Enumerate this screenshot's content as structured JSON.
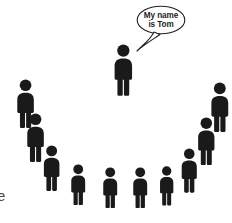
{
  "image": {
    "kind": "illustration",
    "description": "Group of people pictograms arranged in a semicircle, one person introducing themselves",
    "background_color": "#ffffff",
    "figure_color": "#1a1a1a"
  },
  "speech_bubble": {
    "line1": "My name",
    "line2": "is Tom",
    "full_text": "My name is Tom",
    "fill_color": "#ffffff",
    "stroke_color": "#231f20",
    "text_color": "#231f20",
    "font_size_px": 8.2,
    "x": 136,
    "y": 5,
    "width": 50,
    "height": 30
  },
  "corner_text": {
    "label": "e",
    "color": "#4a4a4a",
    "font_size_px": 15,
    "note": "partially cropped letter at lower-left edge"
  },
  "figures": [
    {
      "id": "speaker-tom",
      "role": "speaker",
      "x": 108,
      "y": 44,
      "scale": 1.18,
      "color": "#1a1a1a"
    },
    {
      "id": "listener-1",
      "role": "listener",
      "x": 11,
      "y": 79,
      "scale": 1.12,
      "color": "#1a1a1a"
    },
    {
      "id": "listener-2",
      "role": "listener",
      "x": 21,
      "y": 113,
      "scale": 1.12,
      "color": "#1a1a1a"
    },
    {
      "id": "listener-3",
      "role": "listener",
      "x": 38,
      "y": 145,
      "scale": 1.05,
      "color": "#1a1a1a"
    },
    {
      "id": "listener-4",
      "role": "listener",
      "x": 66,
      "y": 164,
      "scale": 0.94,
      "color": "#1a1a1a"
    },
    {
      "id": "listener-5",
      "role": "listener",
      "x": 98,
      "y": 167,
      "scale": 0.94,
      "color": "#1a1a1a"
    },
    {
      "id": "listener-6",
      "role": "listener",
      "x": 128,
      "y": 167,
      "scale": 0.94,
      "color": "#1a1a1a"
    },
    {
      "id": "listener-7",
      "role": "listener",
      "x": 155,
      "y": 166,
      "scale": 0.9,
      "color": "#1a1a1a"
    },
    {
      "id": "listener-8",
      "role": "listener",
      "x": 176,
      "y": 148,
      "scale": 1.02,
      "color": "#1a1a1a"
    },
    {
      "id": "listener-9",
      "role": "listener",
      "x": 192,
      "y": 117,
      "scale": 1.1,
      "color": "#1a1a1a"
    },
    {
      "id": "listener-10",
      "role": "listener",
      "x": 205,
      "y": 82,
      "scale": 1.14,
      "color": "#1a1a1a"
    }
  ]
}
